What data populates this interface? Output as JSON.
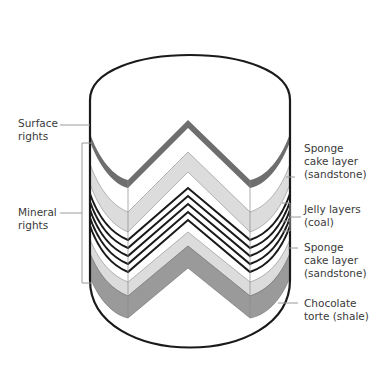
{
  "diagram": {
    "type": "cutaway-cylinder",
    "labels_left": [
      {
        "id": "surface",
        "text": "Surface\nrights"
      },
      {
        "id": "mineral",
        "text": "Mineral\nrights"
      }
    ],
    "labels_right": [
      {
        "id": "sponge-top",
        "text": "Sponge\ncake layer\n(sandstone)"
      },
      {
        "id": "jelly",
        "text": "Jelly layers\n(coal)"
      },
      {
        "id": "sponge-bottom",
        "text": "Sponge\ncake layer\n(sandstone)"
      },
      {
        "id": "chocolate",
        "text": "Chocolate\ntorte (shale)"
      }
    ],
    "layers": [
      {
        "name": "surface-band",
        "color": "#6e6e6e"
      },
      {
        "name": "sponge-top",
        "color": "#dcdcdc"
      },
      {
        "name": "jelly",
        "color": "#1a1a1a",
        "count": 5
      },
      {
        "name": "sponge-bottom",
        "color": "#dcdcdc"
      },
      {
        "name": "chocolate",
        "color": "#9a9a9a"
      }
    ],
    "colors": {
      "outline": "#1a1a1a",
      "leader": "#9a9a9a",
      "text": "#3a3a3a"
    }
  }
}
